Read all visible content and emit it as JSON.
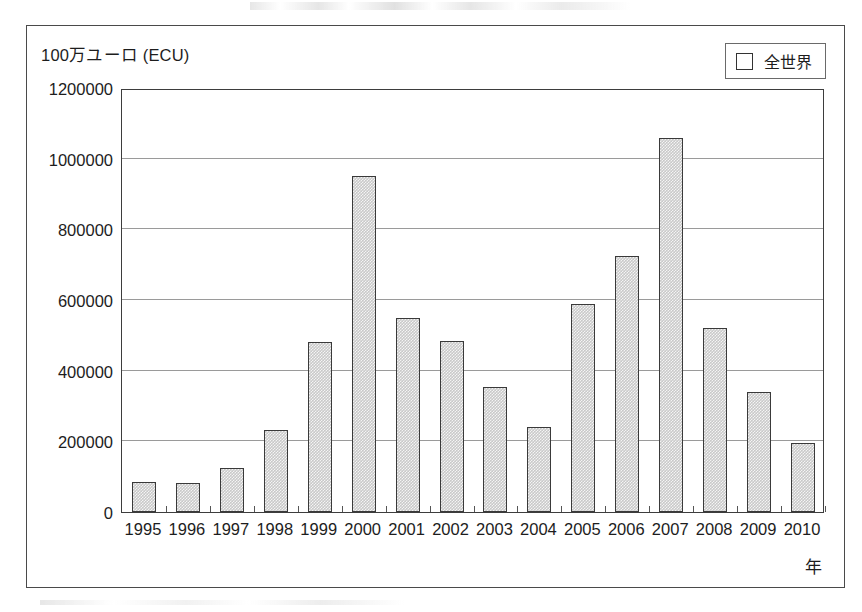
{
  "figure": {
    "y_axis_unit_label": "100万ユーロ (ECU)",
    "x_axis_title": "年"
  },
  "legend": {
    "position": "top-right",
    "swatch_icon": "empty-square-icon",
    "entries": [
      {
        "label": "全世界",
        "fill": "#c9c9c9",
        "border": "#3a3a3a"
      }
    ]
  },
  "chart_data": {
    "type": "bar",
    "title": "",
    "subtitle": "",
    "xlabel": "年",
    "ylabel": "100万ユーロ (ECU)",
    "categories": [
      "1995",
      "1996",
      "1997",
      "1998",
      "1999",
      "2000",
      "2001",
      "2002",
      "2003",
      "2004",
      "2005",
      "2006",
      "2007",
      "2008",
      "2009",
      "2010"
    ],
    "series": [
      {
        "name": "全世界",
        "values": [
          86000,
          82000,
          124000,
          232000,
          480000,
          950000,
          548000,
          484000,
          354000,
          240000,
          588000,
          724000,
          1058000,
          520000,
          340000,
          194000
        ]
      }
    ],
    "ylim": [
      0,
      1200000
    ],
    "ytick_labels": [
      "0",
      "200000",
      "400000",
      "600000",
      "800000",
      "1000000",
      "1200000"
    ],
    "ytick_values": [
      0,
      200000,
      400000,
      600000,
      800000,
      1000000,
      1200000
    ],
    "grid": true,
    "grid_axis": "y",
    "legend_position": "upper right"
  },
  "colors": {
    "bar_fill": "#c9c9c9",
    "bar_border": "#3a3a3a",
    "gridline": "#9a9a9a",
    "axis": "#3d3d3d",
    "frame": "#4a4a4a",
    "text": "#1d1d1d"
  }
}
